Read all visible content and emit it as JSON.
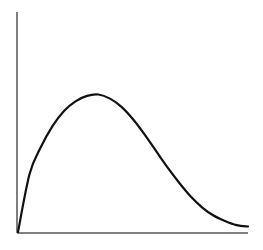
{
  "chart_data": {
    "type": "line",
    "title": "",
    "xlabel": "",
    "ylabel": "",
    "grid": false,
    "legend": null,
    "x": [
      0,
      0.05,
      0.1,
      0.15,
      0.2,
      0.25,
      0.3,
      0.35,
      0.4,
      0.45,
      0.5,
      0.55,
      0.6,
      0.65,
      0.7,
      0.75,
      0.8,
      0.85,
      0.9,
      0.95,
      1.0
    ],
    "series": [
      {
        "name": "curve",
        "values": [
          0,
          0.42,
          0.62,
          0.77,
          0.88,
          0.95,
          0.99,
          1.0,
          0.97,
          0.91,
          0.82,
          0.71,
          0.59,
          0.47,
          0.36,
          0.26,
          0.18,
          0.12,
          0.08,
          0.05,
          0.04
        ]
      }
    ],
    "xlim": [
      0,
      1
    ],
    "ylim": [
      0,
      1.6
    ]
  },
  "style": {
    "axis_color": "#555555",
    "line_color": "#111111",
    "background": "#ffffff"
  }
}
